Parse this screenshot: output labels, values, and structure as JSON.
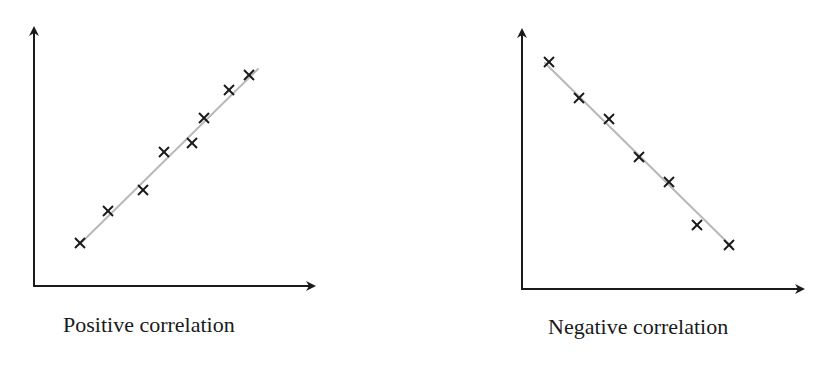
{
  "colors": {
    "axis": "#1a1a1a",
    "marker": "#1a1a1a",
    "fit_line": "#b8b8b8",
    "background": "#ffffff"
  },
  "panels": [
    {
      "id": "positive",
      "caption": "Positive correlation",
      "axes": {
        "origin_px": [
          34,
          286
        ],
        "x_end_px": [
          316,
          286
        ],
        "y_end_px": [
          34,
          26
        ]
      },
      "fit_line_px": [
        [
          80,
          244
        ],
        [
          258,
          69
        ]
      ],
      "points_px": [
        [
          80,
          243
        ],
        [
          108,
          211
        ],
        [
          143,
          190
        ],
        [
          164,
          152
        ],
        [
          192,
          143
        ],
        [
          204,
          118
        ],
        [
          229,
          90
        ],
        [
          249,
          75
        ]
      ]
    },
    {
      "id": "negative",
      "caption": "Negative correlation",
      "axes": {
        "origin_px": [
          522,
          289
        ],
        "x_end_px": [
          805,
          289
        ],
        "y_end_px": [
          522,
          28
        ]
      },
      "fit_line_px": [
        [
          545,
          63
        ],
        [
          732,
          247
        ]
      ],
      "points_px": [
        [
          549,
          62
        ],
        [
          579,
          98
        ],
        [
          609,
          119
        ],
        [
          639,
          157
        ],
        [
          669,
          182
        ],
        [
          697,
          225
        ],
        [
          729,
          245
        ]
      ]
    }
  ],
  "chart_data": [
    {
      "type": "scatter",
      "title": "Positive correlation",
      "xlabel": "",
      "ylabel": "",
      "grid": false,
      "legend": null,
      "axis_ticks": false,
      "xlim": [
        0,
        10
      ],
      "ylim": [
        0,
        10
      ],
      "trendline": {
        "type": "linear",
        "direction": "positive",
        "color": "#b8b8b8"
      },
      "marker": "x",
      "series": [
        {
          "name": "data",
          "x": [
            1.6,
            2.6,
            3.9,
            4.6,
            5.6,
            6.0,
            6.9,
            7.6
          ],
          "y": [
            1.7,
            2.9,
            3.7,
            5.2,
            5.5,
            6.5,
            7.5,
            8.1
          ]
        }
      ]
    },
    {
      "type": "scatter",
      "title": "Negative correlation",
      "xlabel": "",
      "ylabel": "",
      "grid": false,
      "legend": null,
      "axis_ticks": false,
      "xlim": [
        0,
        10
      ],
      "ylim": [
        0,
        10
      ],
      "trendline": {
        "type": "linear",
        "direction": "negative",
        "color": "#b8b8b8"
      },
      "marker": "x",
      "series": [
        {
          "name": "data",
          "x": [
            1.0,
            2.0,
            3.1,
            4.1,
            5.2,
            6.2,
            7.3
          ],
          "y": [
            8.7,
            7.3,
            6.5,
            5.1,
            4.1,
            2.5,
            1.7
          ]
        }
      ]
    }
  ]
}
